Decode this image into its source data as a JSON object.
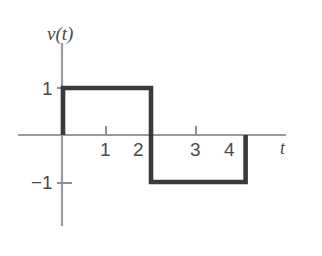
{
  "figure": {
    "background_color": "#ffffff",
    "axis_color": "#9b9b9b",
    "signal_color": "#3a3a3a",
    "text_color": "#4a4a4a",
    "y_axis_label": "v(t)",
    "x_axis_label": "t",
    "y_tick_labels": [
      "1",
      "-1"
    ],
    "x_tick_labels": [
      "1",
      "2",
      "3",
      "4"
    ]
  },
  "chart_data": {
    "type": "line",
    "title": "",
    "subtitle": "",
    "xlabel": "t",
    "ylabel": "v(t)",
    "xlim": [
      -0.3,
      5.0
    ],
    "ylim": [
      -1.8,
      1.8
    ],
    "xticks": [
      1,
      2,
      3,
      4
    ],
    "xticklabels": [
      "1",
      "2",
      "3",
      "4"
    ],
    "yticks": [
      1,
      -1
    ],
    "yticklabels": [
      "1",
      "-1"
    ],
    "grid": false,
    "legend": null,
    "series": [
      {
        "name": "v(t)",
        "color": "#3a3a3a",
        "linewidth": 4.6,
        "x": [
          0,
          0,
          2,
          2,
          4.15,
          4.15
        ],
        "y": [
          0,
          1,
          1,
          -1,
          -1,
          0
        ]
      }
    ],
    "annotations": []
  },
  "labels": {
    "v_of_t": "v(t)",
    "t": "t",
    "y_pos_one": "1",
    "y_neg_one": "−1",
    "x_one": "1",
    "x_two": "2",
    "x_three": "3",
    "x_four": "4"
  }
}
